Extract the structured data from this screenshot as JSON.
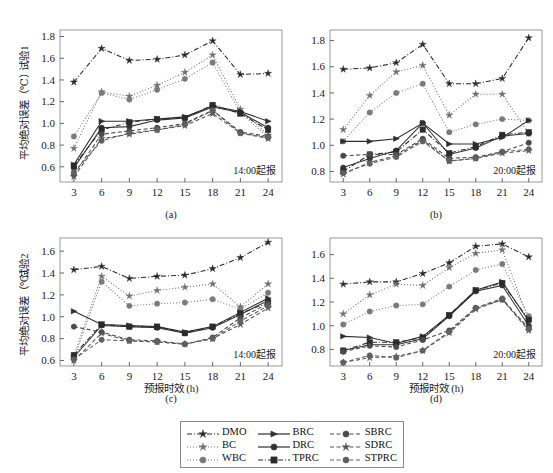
{
  "figure": {
    "width": 553,
    "height": 473,
    "background": "#ffffff",
    "axis_color": "#9a9a9a",
    "text_color": "#1a1a1a"
  },
  "legend": {
    "position": "bottom-center",
    "entries": [
      {
        "label": "DMO",
        "marker": "star",
        "dash": "dashdot",
        "color": "#2a2a2a"
      },
      {
        "label": "BC",
        "marker": "star",
        "dash": "dotted",
        "color": "#6e6e6e"
      },
      {
        "label": "WBC",
        "marker": "circle",
        "dash": "dotted",
        "color": "#7a7a7a"
      },
      {
        "label": "BRC",
        "marker": "triangle",
        "dash": "solid",
        "color": "#2e2e2e"
      },
      {
        "label": "DRC",
        "marker": "circle",
        "dash": "solid",
        "color": "#333333"
      },
      {
        "label": "TPRC",
        "marker": "square",
        "dash": "dashdot",
        "color": "#2b2b2b"
      },
      {
        "label": "SBRC",
        "marker": "circle",
        "dash": "dashed",
        "color": "#4a4a4a"
      },
      {
        "label": "SDRC",
        "marker": "star",
        "dash": "dashed",
        "color": "#555555"
      },
      {
        "label": "STPRC",
        "marker": "circle",
        "dash": "dashed",
        "color": "#606060"
      }
    ]
  },
  "chart_data": [
    {
      "id": "a",
      "type": "line",
      "panel_label": "(a)",
      "annotation": "14:00起报",
      "ylabel_top": "试验1",
      "ylabel": "平均绝对误差（℃）",
      "xlabel": "",
      "x": [
        3,
        6,
        9,
        12,
        15,
        18,
        21,
        24
      ],
      "xticklabels": [
        "3",
        "6",
        "9",
        "12",
        "15",
        "18",
        "21",
        "24"
      ],
      "ylim": [
        0.46,
        1.86
      ],
      "yticks": [
        0.6,
        0.8,
        1.0,
        1.2,
        1.4,
        1.6,
        1.8
      ],
      "yticklabels": [
        "0.6",
        "0.8",
        "1.0",
        "1.2",
        "1.4",
        "1.6",
        "1.8"
      ],
      "grid": false,
      "series": [
        {
          "name": "DMO",
          "values": [
            1.38,
            1.69,
            1.58,
            1.59,
            1.63,
            1.76,
            1.45,
            1.46
          ]
        },
        {
          "name": "BC",
          "values": [
            0.77,
            1.29,
            1.25,
            1.35,
            1.47,
            1.63,
            1.13,
            0.89
          ]
        },
        {
          "name": "WBC",
          "values": [
            0.88,
            1.28,
            1.22,
            1.31,
            1.41,
            1.56,
            1.1,
            0.87
          ]
        },
        {
          "name": "BRC",
          "values": [
            0.62,
            1.02,
            1.02,
            1.04,
            1.06,
            1.16,
            1.11,
            1.02
          ]
        },
        {
          "name": "DRC",
          "values": [
            0.59,
            0.96,
            0.97,
            1.03,
            1.05,
            1.15,
            1.1,
            0.96
          ]
        },
        {
          "name": "TPRC",
          "values": [
            0.61,
            0.94,
            1.01,
            1.04,
            1.05,
            1.17,
            1.09,
            0.94
          ]
        },
        {
          "name": "SBRC",
          "values": [
            0.53,
            0.9,
            0.93,
            0.96,
            1.0,
            1.12,
            0.92,
            0.88
          ]
        },
        {
          "name": "SDRC",
          "values": [
            0.51,
            0.86,
            0.9,
            0.94,
            0.98,
            1.09,
            0.91,
            0.86
          ]
        },
        {
          "name": "STPRC",
          "values": [
            0.55,
            0.84,
            0.91,
            0.94,
            0.99,
            1.12,
            0.91,
            0.87
          ]
        }
      ]
    },
    {
      "id": "b",
      "type": "line",
      "panel_label": "(b)",
      "annotation": "20:00起报",
      "ylabel_top": "",
      "ylabel": "",
      "xlabel": "",
      "x": [
        3,
        6,
        9,
        12,
        15,
        18,
        21,
        24
      ],
      "xticklabels": [
        "3",
        "6",
        "9",
        "12",
        "15",
        "18",
        "21",
        "24"
      ],
      "ylim": [
        0.72,
        1.88
      ],
      "yticks": [
        0.8,
        1.0,
        1.2,
        1.4,
        1.6,
        1.8
      ],
      "yticklabels": [
        "0.8",
        "1.0",
        "1.2",
        "1.4",
        "1.6",
        "1.8"
      ],
      "grid": false,
      "series": [
        {
          "name": "DMO",
          "values": [
            1.58,
            1.59,
            1.63,
            1.77,
            1.47,
            1.47,
            1.51,
            1.82
          ]
        },
        {
          "name": "BC",
          "values": [
            1.12,
            1.38,
            1.56,
            1.61,
            1.23,
            1.39,
            1.39,
            1.09
          ]
        },
        {
          "name": "WBC",
          "values": [
            1.03,
            1.25,
            1.4,
            1.47,
            1.1,
            1.16,
            1.2,
            1.19
          ]
        },
        {
          "name": "BRC",
          "values": [
            1.03,
            1.03,
            1.05,
            1.17,
            1.01,
            1.01,
            1.06,
            1.19
          ]
        },
        {
          "name": "DRC",
          "values": [
            0.83,
            0.9,
            0.96,
            1.17,
            0.93,
            0.98,
            1.07,
            1.09
          ]
        },
        {
          "name": "TPRC",
          "values": [
            0.8,
            0.93,
            0.95,
            1.12,
            0.94,
            0.99,
            1.08,
            1.1
          ]
        },
        {
          "name": "SBRC",
          "values": [
            0.92,
            0.93,
            0.93,
            1.05,
            0.9,
            0.91,
            0.95,
            1.02
          ]
        },
        {
          "name": "SDRC",
          "values": [
            0.78,
            0.87,
            0.92,
            1.04,
            0.88,
            0.9,
            0.94,
            0.96
          ]
        },
        {
          "name": "STPRC",
          "values": [
            0.79,
            0.86,
            0.91,
            1.03,
            0.88,
            0.9,
            0.95,
            0.97
          ]
        }
      ]
    },
    {
      "id": "c",
      "type": "line",
      "panel_label": "(c)",
      "annotation": "14:00起报",
      "ylabel_top": "试验2",
      "ylabel": "平均绝对误差（℃）",
      "xlabel": "预报时效 (h)",
      "x": [
        3,
        6,
        9,
        12,
        15,
        18,
        21,
        24
      ],
      "xticklabels": [
        "3",
        "6",
        "9",
        "12",
        "15",
        "18",
        "21",
        "24"
      ],
      "ylim": [
        0.55,
        1.72
      ],
      "yticks": [
        0.6,
        0.8,
        1.0,
        1.2,
        1.4,
        1.6
      ],
      "yticklabels": [
        "0.6",
        "0.8",
        "1.0",
        "1.2",
        "1.4",
        "1.6"
      ],
      "grid": false,
      "series": [
        {
          "name": "DMO",
          "values": [
            1.43,
            1.46,
            1.35,
            1.37,
            1.38,
            1.44,
            1.54,
            1.68
          ]
        },
        {
          "name": "BC",
          "values": [
            0.64,
            1.37,
            1.19,
            1.24,
            1.27,
            1.3,
            1.09,
            1.3
          ]
        },
        {
          "name": "WBC",
          "values": [
            0.62,
            1.32,
            1.1,
            1.12,
            1.13,
            1.16,
            1.07,
            1.22
          ]
        },
        {
          "name": "BRC",
          "values": [
            1.05,
            0.93,
            0.92,
            0.91,
            0.86,
            0.91,
            1.04,
            1.17
          ]
        },
        {
          "name": "DRC",
          "values": [
            0.63,
            0.92,
            0.91,
            0.9,
            0.85,
            0.9,
            1.02,
            1.15
          ]
        },
        {
          "name": "TPRC",
          "values": [
            0.65,
            0.93,
            0.91,
            0.91,
            0.85,
            0.91,
            1.03,
            1.13
          ]
        },
        {
          "name": "SBRC",
          "values": [
            0.91,
            0.86,
            0.79,
            0.78,
            0.75,
            0.81,
            0.99,
            1.12
          ]
        },
        {
          "name": "SDRC",
          "values": [
            0.6,
            0.85,
            0.78,
            0.77,
            0.75,
            0.8,
            0.93,
            1.08
          ]
        },
        {
          "name": "STPRC",
          "values": [
            0.61,
            0.79,
            0.78,
            0.77,
            0.75,
            0.8,
            0.96,
            1.1
          ]
        }
      ]
    },
    {
      "id": "d",
      "type": "line",
      "panel_label": "(d)",
      "annotation": "20:00起报",
      "ylabel_top": "",
      "ylabel": "",
      "xlabel": "预报时效 (h)",
      "x": [
        3,
        6,
        9,
        12,
        15,
        18,
        21,
        24
      ],
      "xticklabels": [
        "3",
        "6",
        "9",
        "12",
        "15",
        "18",
        "21",
        "24"
      ],
      "ylim": [
        0.66,
        1.74
      ],
      "yticks": [
        0.8,
        1.0,
        1.2,
        1.4,
        1.6
      ],
      "yticklabels": [
        "0.8",
        "1.0",
        "1.2",
        "1.4",
        "1.6"
      ],
      "grid": false,
      "series": [
        {
          "name": "DMO",
          "values": [
            1.35,
            1.37,
            1.37,
            1.44,
            1.53,
            1.67,
            1.69,
            1.58
          ]
        },
        {
          "name": "BC",
          "values": [
            1.1,
            1.26,
            1.35,
            1.34,
            1.49,
            1.61,
            1.64,
            1.05
          ]
        },
        {
          "name": "WBC",
          "values": [
            1.01,
            1.12,
            1.17,
            1.18,
            1.33,
            1.47,
            1.52,
            1.08
          ]
        },
        {
          "name": "BRC",
          "values": [
            0.91,
            0.9,
            0.85,
            0.91,
            1.09,
            1.3,
            1.37,
            1.04
          ]
        },
        {
          "name": "DRC",
          "values": [
            0.79,
            0.84,
            0.84,
            0.89,
            1.08,
            1.29,
            1.34,
            1.0
          ]
        },
        {
          "name": "TPRC",
          "values": [
            0.79,
            0.86,
            0.86,
            0.9,
            1.09,
            1.3,
            1.36,
            1.05
          ]
        },
        {
          "name": "SBRC",
          "values": [
            0.78,
            0.83,
            0.82,
            0.88,
            0.96,
            1.15,
            1.22,
            0.98
          ]
        },
        {
          "name": "SDRC",
          "values": [
            0.69,
            0.73,
            0.74,
            0.79,
            0.94,
            1.14,
            1.22,
            0.96
          ]
        },
        {
          "name": "STPRC",
          "values": [
            0.69,
            0.75,
            0.73,
            0.79,
            0.95,
            1.15,
            1.23,
            0.97
          ]
        }
      ]
    }
  ]
}
